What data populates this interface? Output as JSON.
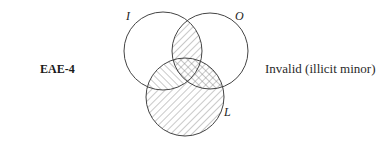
{
  "form": {
    "label": "EAE-4"
  },
  "verdict": {
    "text": "Invalid (illicit minor)"
  },
  "venn": {
    "sets": [
      {
        "id": "I",
        "label": "I",
        "cx": 163,
        "cy": 51,
        "r": 39
      },
      {
        "id": "O",
        "label": "O",
        "cx": 210,
        "cy": 51,
        "r": 38
      },
      {
        "id": "L",
        "label": "L",
        "cx": 185,
        "cy": 97,
        "r": 39
      }
    ],
    "shading": {
      "back_slash_region": "L minus (I minus O)",
      "forward_slash_region": "L within (I or O)",
      "crosshatched": "L and O"
    },
    "line_color": "#444444",
    "hatch_color": "#777777"
  }
}
